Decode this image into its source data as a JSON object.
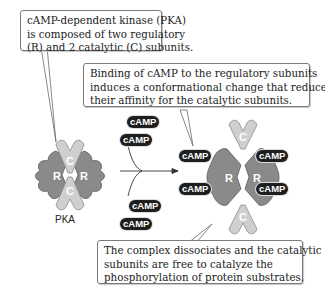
{
  "callouts": {
    "pka_composition": {
      "lines": [
        "cAMP-dependent kinase (PKA)",
        "is composed of two regulatory",
        "(R) and 2 catalytic (C) subunits."
      ]
    },
    "camp_binding": {
      "lines": [
        "Binding of cAMP to the regulatory subunits",
        "induces a conformational change that reduces",
        "their affinity for the catalytic subunits."
      ]
    },
    "dissociation": {
      "lines": [
        "The complex dissociates and the catalytic",
        "subunits are free to catalyze the",
        "phosphorylation of protein substrates."
      ]
    }
  },
  "labels": {
    "pka": "PKA",
    "regulatory_letter": "R",
    "catalytic_letter": "C"
  },
  "camp_tags": {
    "free_top": [
      "cAMP",
      "cAMP"
    ],
    "free_bottom": [
      "cAMP",
      "cAMP"
    ],
    "bound_left": [
      "cAMP",
      "cAMP"
    ],
    "bound_right": [
      "cAMP",
      "cAMP"
    ]
  },
  "colors": {
    "regulatory": "#8a8a8a",
    "catalytic": "#cfcfcf",
    "camp_badge": "#1e1e1e",
    "callout_border": "#7a7a7a"
  }
}
